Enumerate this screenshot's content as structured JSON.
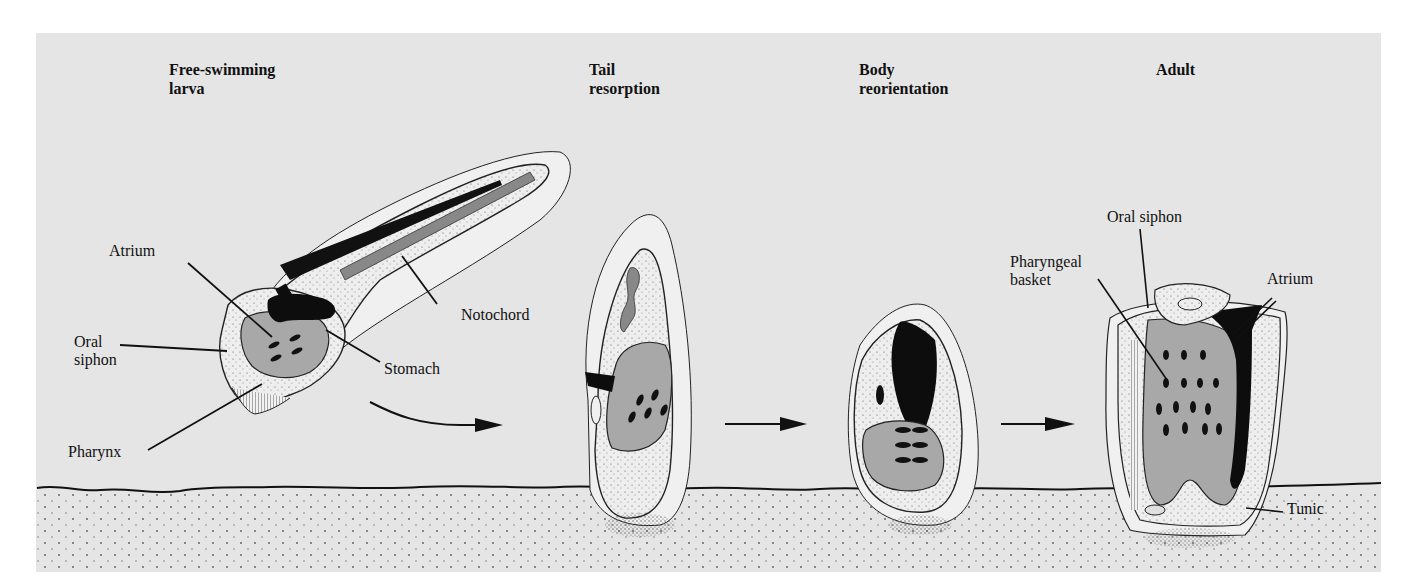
{
  "figure": {
    "stages": [
      {
        "id": "larva",
        "title_line1": "Free-swimming",
        "title_line2": "larva"
      },
      {
        "id": "tail",
        "title_line1": "Tail",
        "title_line2": "resorption"
      },
      {
        "id": "body",
        "title_line1": "Body",
        "title_line2": "reorientation"
      },
      {
        "id": "adult",
        "title_line1": "Adult",
        "title_line2": ""
      }
    ],
    "larva_labels": {
      "atrium": "Atrium",
      "oral_siphon_line1": "Oral",
      "oral_siphon_line2": "siphon",
      "pharynx": "Pharynx",
      "notochord": "Notochord",
      "stomach": "Stomach"
    },
    "adult_labels": {
      "oral_siphon": "Oral siphon",
      "pharyngeal_basket_line1": "Pharyngeal",
      "pharyngeal_basket_line2": "basket",
      "atrium": "Atrium",
      "tunic": "Tunic"
    },
    "colors": {
      "panel": "#e5e5e5",
      "tissue_light": "#ececec",
      "tissue_mid": "#a8a8a8",
      "cavity_dark": "#0d0d0d",
      "outline": "#1a1a1a"
    }
  }
}
